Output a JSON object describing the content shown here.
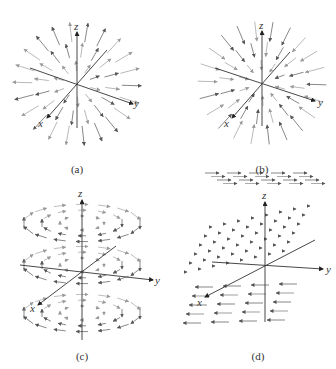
{
  "figure": {
    "panels": [
      {
        "id": "a",
        "caption": "(a)",
        "type": "radial-outward",
        "axes": {
          "x": "x",
          "y": "y",
          "z": "z"
        },
        "origin": [
          77,
          84
        ],
        "z_tip": [
          77,
          32
        ],
        "z_bottom": [
          77,
          128
        ],
        "y_tip": [
          133,
          104
        ],
        "y_back": [
          30,
          68
        ],
        "x_tip": [
          47,
          118
        ],
        "x_back": [
          107,
          50
        ],
        "caption_pos": [
          77,
          163
        ],
        "labels": {
          "z": [
            74,
            20
          ],
          "y": [
            134,
            97
          ],
          "x": [
            38,
            117
          ]
        }
      },
      {
        "id": "b",
        "caption": "(b)",
        "type": "radial-inward",
        "axes": {
          "x": "x",
          "y": "y",
          "z": "z"
        },
        "origin": [
          262,
          83
        ],
        "z_tip": [
          262,
          31
        ],
        "z_bottom": [
          262,
          126
        ],
        "y_tip": [
          315,
          101
        ],
        "y_back": [
          215,
          68
        ],
        "x_tip": [
          232,
          118
        ],
        "x_back": [
          290,
          52
        ],
        "caption_pos": [
          262,
          163
        ],
        "labels": {
          "z": [
            259,
            19
          ],
          "y": [
            318,
            96
          ],
          "x": [
            224,
            117
          ]
        }
      },
      {
        "id": "c",
        "caption": "(c)",
        "type": "rotational-about-z",
        "axes": {
          "x": "x",
          "y": "y",
          "z": "z"
        },
        "origin": [
          82,
          273
        ],
        "z_tip": [
          82,
          200
        ],
        "z_bottom": [
          82,
          340
        ],
        "y_tip": [
          153,
          280
        ],
        "y_back": [
          20,
          265
        ],
        "x_tip": [
          38,
          305
        ],
        "x_back": [
          116,
          246
        ],
        "caption_pos": [
          82,
          350
        ],
        "labels": {
          "z": [
            78,
            187
          ],
          "y": [
            155,
            274
          ],
          "x": [
            30,
            302
          ]
        }
      },
      {
        "id": "d",
        "caption": "(d)",
        "type": "layered-uniform-y",
        "axes": {
          "x": "x",
          "y": "y",
          "z": "z"
        },
        "origin": [
          265,
          265
        ],
        "z_tip": [
          265,
          202
        ],
        "z_bottom": [
          265,
          322
        ],
        "y_tip": [
          323,
          269
        ],
        "y_back": [
          212,
          262
        ],
        "x_tip": [
          205,
          297
        ],
        "x_back": [
          315,
          240
        ],
        "caption_pos": [
          258,
          350
        ],
        "labels": {
          "z": [
            262,
            189
          ],
          "y": [
            326,
            263
          ],
          "x": [
            197,
            296
          ]
        }
      }
    ],
    "colors": {
      "axis": "#333333",
      "arrow_dark": "#555555",
      "arrow_light": "#9a9a9a",
      "text": "#333333"
    }
  }
}
